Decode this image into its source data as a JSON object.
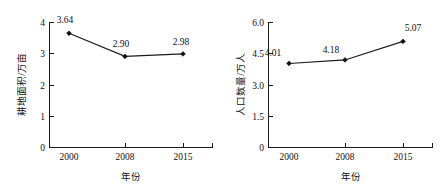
{
  "chart_data": [
    {
      "type": "line",
      "panel": "left",
      "title": "",
      "xlabel": "年份",
      "ylabel": "耕地面积/万亩",
      "categories": [
        "2000",
        "2008",
        "2015"
      ],
      "x": [
        2000,
        2008,
        2015
      ],
      "values": [
        3.64,
        2.9,
        2.98
      ],
      "point_labels": [
        "3.64",
        "2.90",
        "2.98"
      ],
      "ylim": [
        0,
        4
      ],
      "yticks": [
        0,
        1,
        2,
        3,
        4
      ],
      "ytick_labels": [
        "0",
        "1",
        "2",
        "3",
        "4"
      ],
      "xtick_labels": [
        "2000",
        "2008",
        "2015"
      ],
      "grid": false,
      "legend": "none",
      "marker": "filled-diamond",
      "line_color": "#1a1a1a",
      "marker_color": "#111111"
    },
    {
      "type": "line",
      "panel": "right",
      "title": "",
      "xlabel": "年份",
      "ylabel": "人口数量/万人",
      "categories": [
        "2000",
        "2008",
        "2015"
      ],
      "x": [
        2000,
        2008,
        2015
      ],
      "values": [
        4.01,
        4.18,
        5.07
      ],
      "point_labels": [
        "4.01",
        "4.18",
        "5.07"
      ],
      "ylim": [
        0,
        6.0
      ],
      "yticks": [
        0,
        1.5,
        3.0,
        4.5,
        6.0
      ],
      "ytick_labels": [
        "0",
        "1.5",
        "3.0",
        "4.5",
        "6.0"
      ],
      "xtick_labels": [
        "2000",
        "2008",
        "2015"
      ],
      "grid": false,
      "legend": "none",
      "marker": "filled-diamond",
      "line_color": "#1a1a1a",
      "marker_color": "#111111"
    }
  ]
}
